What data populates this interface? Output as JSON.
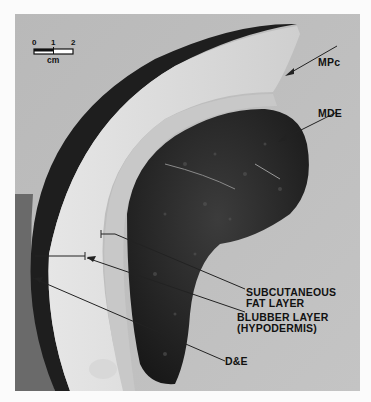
{
  "figure": {
    "scale_bar": {
      "ticks": [
        "0",
        "1",
        "2"
      ],
      "unit": "cm"
    },
    "labels": {
      "mpc": "MPc",
      "mde": "MDE",
      "subcutaneous_line1": "SUBCUTANEOUS",
      "subcutaneous_line2": "FAT LAYER",
      "blubber_line1": "BLUBBER LAYER",
      "blubber_line2": "(HYPODERMIS)",
      "de": "D&E"
    },
    "colors": {
      "background": "#bdbdbd",
      "blubber": "#dcdcdc",
      "tissue": "#2a2a2a",
      "skin": "#1e1e1e",
      "label_text": "#111111"
    }
  }
}
